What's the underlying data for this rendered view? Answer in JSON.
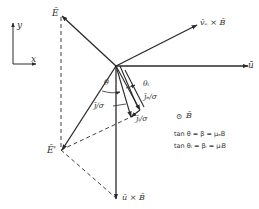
{
  "axes_inset": {
    "y_label": "y",
    "x_label": "x"
  },
  "vectors": {
    "u": {
      "label": "ū"
    },
    "ve_cross_B": {
      "label": "v̄ₑ × B̄"
    },
    "E": {
      "label": "Ē"
    },
    "E_prime": {
      "label": "Ē'"
    },
    "u_cross_B": {
      "label": "ū × B̄"
    },
    "j_over_sigma": {
      "label": "j̄/σ"
    },
    "je_over_sigma": {
      "label": "j̄ₑ/σ"
    },
    "ji_over_sigma": {
      "label": "j̄ᵢ/σ"
    }
  },
  "angles": {
    "theta": "θ",
    "theta_i": "θᵢ"
  },
  "field_symbol": {
    "marker": "⊙",
    "label": "B̄"
  },
  "equations": [
    {
      "text": "tan  θ  =  β  =  μₑB"
    },
    {
      "text": "tan  θᵢ  =  βᵢ  =  μᵢB"
    }
  ],
  "colors": {
    "line": "#2a2a2a",
    "text": "#333333",
    "background": "#ffffff"
  }
}
